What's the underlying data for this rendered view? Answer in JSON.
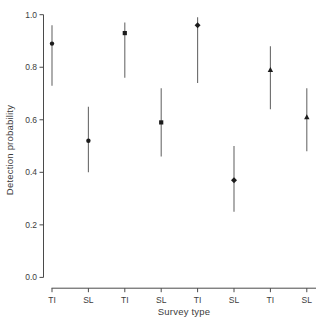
{
  "chart_data": {
    "type": "scatter",
    "title": "",
    "xlabel": "Survey type",
    "ylabel": "Detection probability",
    "ylim": [
      0.0,
      1.0
    ],
    "grid": false,
    "legend": "none",
    "frame": "axes-left-bottom-only",
    "y_ticks": [
      0.0,
      0.2,
      0.4,
      0.6,
      0.8,
      1.0
    ],
    "y_tick_labels": [
      "0.0",
      "0.2",
      "0.4",
      "0.6",
      "0.8",
      "1.0"
    ],
    "categories": [
      "TI",
      "SL",
      "TI",
      "SL",
      "TI",
      "SL",
      "TI",
      "SL"
    ],
    "points": [
      {
        "category": "TI",
        "pair": 1,
        "estimate": 0.89,
        "ci_low": 0.73,
        "ci_high": 0.96,
        "marker": "circle"
      },
      {
        "category": "SL",
        "pair": 1,
        "estimate": 0.52,
        "ci_low": 0.4,
        "ci_high": 0.65,
        "marker": "circle"
      },
      {
        "category": "TI",
        "pair": 2,
        "estimate": 0.93,
        "ci_low": 0.76,
        "ci_high": 0.97,
        "marker": "square"
      },
      {
        "category": "SL",
        "pair": 2,
        "estimate": 0.59,
        "ci_low": 0.46,
        "ci_high": 0.72,
        "marker": "square"
      },
      {
        "category": "TI",
        "pair": 3,
        "estimate": 0.96,
        "ci_low": 0.74,
        "ci_high": 0.99,
        "marker": "diamond"
      },
      {
        "category": "SL",
        "pair": 3,
        "estimate": 0.37,
        "ci_low": 0.25,
        "ci_high": 0.5,
        "marker": "diamond"
      },
      {
        "category": "TI",
        "pair": 4,
        "estimate": 0.79,
        "ci_low": 0.64,
        "ci_high": 0.88,
        "marker": "triangle"
      },
      {
        "category": "SL",
        "pair": 4,
        "estimate": 0.61,
        "ci_low": 0.48,
        "ci_high": 0.72,
        "marker": "triangle"
      }
    ],
    "colors": {
      "background": "#ffffff",
      "marker": "#1c1c1c",
      "error_bar": "#6b6b6b",
      "axis": "#4a4a4a",
      "text": "#3c3c3c"
    }
  }
}
